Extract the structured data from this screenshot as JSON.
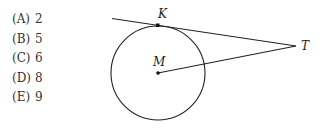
{
  "choices": [
    {
      "letter": "(A)",
      "value": "2"
    },
    {
      "letter": "(B)",
      "value": "5"
    },
    {
      "letter": "(C)",
      "value": "6"
    },
    {
      "letter": "(D)",
      "value": "8"
    },
    {
      "letter": "(E)",
      "value": "9"
    }
  ],
  "figure": {
    "labels": {
      "k": "K",
      "t": "T",
      "m": "M"
    }
  }
}
